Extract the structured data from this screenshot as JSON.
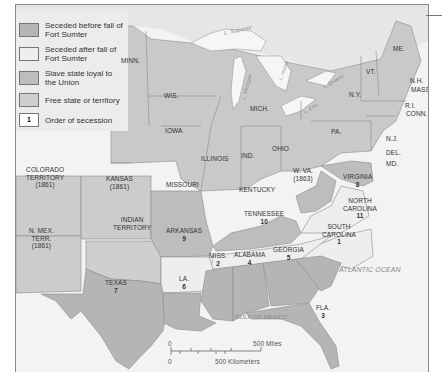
{
  "legend": {
    "items": [
      {
        "label": "Seceded before fall of Fort Sumter",
        "color": "#b5b5b5"
      },
      {
        "label": "Seceded after fall of Fort Sumter",
        "color": "#eeeeee"
      },
      {
        "label": "Slave state loyal to the Union",
        "color": "#bdbdbd"
      },
      {
        "label": "Free state or territory",
        "color": "#cfcfcf"
      },
      {
        "label": "Order of secession",
        "swatch_text": "1",
        "color": "#ffffff"
      }
    ]
  },
  "states": {
    "minn": "MINN.",
    "wis": "WIS.",
    "mich": "MICH.",
    "iowa": "IOWA",
    "illinois": "ILLINOIS",
    "ind": "IND.",
    "ohio": "OHIO",
    "pa": "PA.",
    "ny": "N.Y.",
    "vt": "VT.",
    "me": "ME.",
    "nh": "N.H.",
    "mass": "MASS.",
    "ri": "R.I.",
    "conn": "CONN.",
    "nj": "N.J.",
    "del": "DEL.",
    "md": "MD.",
    "wva": "W. VA.",
    "wva_year": "(1863)",
    "colorado": "COLORADO",
    "colorado2": "TERRITORY",
    "colorado_year": "(1861)",
    "kansas": "KANSAS",
    "kansas_year": "(1861)",
    "missouri": "MISSOURI",
    "kentucky": "KENTUCKY",
    "indian": "INDIAN",
    "indian2": "TERRITORY",
    "nmex": "N. MEX.",
    "nmex2": "TERR.",
    "nmex_year": "(1861)",
    "virginia": "VIRGINIA",
    "virginia_n": "8",
    "nc": "NORTH",
    "nc2": "CAROLINA",
    "nc_n": "11",
    "tennessee": "TENNESSEE",
    "tennessee_n": "10",
    "arkansas": "ARKANSAS",
    "arkansas_n": "9",
    "sc": "SOUTH",
    "sc2": "CAROLINA",
    "sc_n": "1",
    "miss": "MISS.",
    "miss_n": "2",
    "alabama": "ALABAMA",
    "alabama_n": "4",
    "georgia": "GEORGIA",
    "georgia_n": "5",
    "la": "LA.",
    "la_n": "6",
    "texas": "TEXAS",
    "texas_n": "7",
    "fla": "FLA.",
    "fla_n": "3"
  },
  "water": {
    "superior": "L. Superior",
    "michigan": "L. Michigan",
    "huron": "L. Huron",
    "erie": "L. Erie",
    "ontario": "L. Ontario",
    "atlantic": "ATLANTIC OCEAN",
    "gulf": "GULF OF MEXICO"
  },
  "scale": {
    "zero_miles": "0",
    "miles": "500 Miles",
    "zero_km": "0",
    "km": "500 Kilometers"
  }
}
